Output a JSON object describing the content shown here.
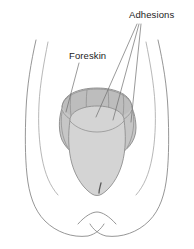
{
  "figure": {
    "background_color": "#ffffff",
    "line_color": "#8a8a8a",
    "glans_fill_color": "#d4d4d4",
    "foreskin_fill_color": "#c6c6c6",
    "text_color": "#1c1c1c"
  },
  "labels": [
    {
      "id": "adhesions",
      "text": "Adhesions",
      "x": 129,
      "y": 18,
      "anchor": "start",
      "leader_count": 3
    },
    {
      "id": "foreskin",
      "text": "Foreskin",
      "x": 69,
      "y": 59,
      "anchor": "start",
      "leader_count": 1
    }
  ],
  "parts": [
    {
      "id": "left-thigh",
      "name": "Left thigh outline"
    },
    {
      "id": "right-thigh",
      "name": "Right thigh outline"
    },
    {
      "id": "perineum-notch",
      "name": "Perineum notch"
    },
    {
      "id": "foreskin-band",
      "name": "Foreskin band"
    },
    {
      "id": "glans",
      "name": "Glans"
    },
    {
      "id": "meatus",
      "name": "Urethral meatus"
    },
    {
      "id": "adhesion-bands",
      "name": "Adhesion bands"
    }
  ]
}
